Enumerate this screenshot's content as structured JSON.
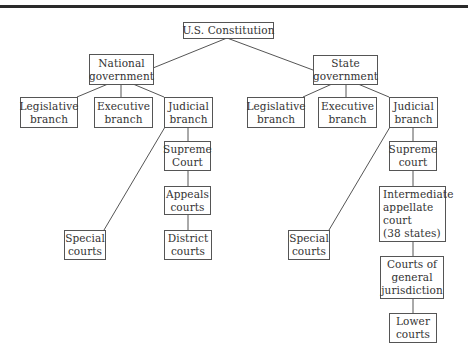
{
  "diagram": {
    "type": "tree",
    "title": "U.S. Constitution",
    "nodes": {
      "constitution": {
        "lines": [
          "U.S. Constitution"
        ]
      },
      "national": {
        "lines": [
          "National",
          "government"
        ]
      },
      "state": {
        "lines": [
          "State",
          "government"
        ]
      },
      "nat_legislative": {
        "lines": [
          "Legislative",
          "branch"
        ]
      },
      "nat_executive": {
        "lines": [
          "Executive",
          "branch"
        ]
      },
      "nat_judicial": {
        "lines": [
          "Judicial",
          "branch"
        ]
      },
      "nat_supreme": {
        "lines": [
          "Supreme",
          "Court"
        ]
      },
      "nat_appeals": {
        "lines": [
          "Appeals",
          "courts"
        ]
      },
      "nat_district": {
        "lines": [
          "District",
          "courts"
        ]
      },
      "nat_special": {
        "lines": [
          "Special",
          "courts"
        ]
      },
      "st_legislative": {
        "lines": [
          "Legislative",
          "branch"
        ]
      },
      "st_executive": {
        "lines": [
          "Executive",
          "branch"
        ]
      },
      "st_judicial": {
        "lines": [
          "Judicial",
          "branch"
        ]
      },
      "st_supreme": {
        "lines": [
          "Supreme",
          "court"
        ]
      },
      "st_intermediate": {
        "lines": [
          "Intermediate",
          "appellate",
          "court",
          "(38 states)"
        ]
      },
      "st_general": {
        "lines": [
          "Courts of",
          "general",
          "jurisdiction"
        ]
      },
      "st_lower": {
        "lines": [
          "Lower",
          "courts"
        ]
      },
      "st_special": {
        "lines": [
          "Special",
          "courts"
        ]
      }
    },
    "edges": [
      [
        "constitution",
        "national"
      ],
      [
        "constitution",
        "state"
      ],
      [
        "national",
        "nat_legislative"
      ],
      [
        "national",
        "nat_executive"
      ],
      [
        "national",
        "nat_judicial"
      ],
      [
        "nat_judicial",
        "nat_supreme"
      ],
      [
        "nat_supreme",
        "nat_appeals"
      ],
      [
        "nat_appeals",
        "nat_district"
      ],
      [
        "nat_judicial",
        "nat_special"
      ],
      [
        "state",
        "st_legislative"
      ],
      [
        "state",
        "st_executive"
      ],
      [
        "state",
        "st_judicial"
      ],
      [
        "st_judicial",
        "st_supreme"
      ],
      [
        "st_supreme",
        "st_intermediate"
      ],
      [
        "st_intermediate",
        "st_general"
      ],
      [
        "st_general",
        "st_lower"
      ],
      [
        "st_judicial",
        "st_special"
      ]
    ]
  }
}
